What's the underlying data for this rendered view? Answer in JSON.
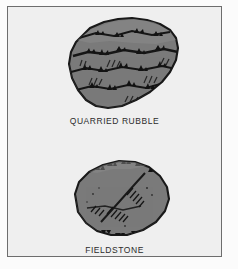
{
  "figure": {
    "background_color": "#f0f0f0",
    "frame_color": "#6d6d6d",
    "stone_fill_color": "#7a7a7a",
    "stone_outline_color": "#1c1c1c",
    "caption_color": "#2b2b2b",
    "items": [
      {
        "id": "quarried-rubble",
        "caption": "QUARRIED RUBBLE",
        "icon_name": "quarried-rubble-stone-illustration",
        "description": "Angular blocky quarried stone block with horizontal striated fracture texture"
      },
      {
        "id": "fieldstone",
        "caption": "FIELDSTONE",
        "icon_name": "fieldstone-stone-illustration",
        "description": "Rounded irregular weathered fieldstone with diagonal hatch shading"
      }
    ]
  }
}
